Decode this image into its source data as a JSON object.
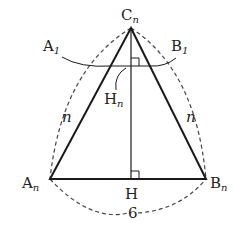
{
  "diagram": {
    "type": "geometry-triangle",
    "points": {
      "apex": {
        "label": "C",
        "sub": "n"
      },
      "left": {
        "label": "A",
        "sub": "n"
      },
      "right": {
        "label": "B",
        "sub": "n"
      },
      "foot": {
        "label": "H"
      },
      "inner_foot": {
        "label": "H",
        "sub": "n"
      },
      "a1": {
        "label": "A",
        "sub": "1"
      },
      "b1": {
        "label": "B",
        "sub": "1"
      }
    },
    "side_labels": {
      "left": "n",
      "right": "n",
      "base": "6"
    },
    "colors": {
      "line": "#1a1a1a",
      "dashed": "#444444"
    }
  }
}
